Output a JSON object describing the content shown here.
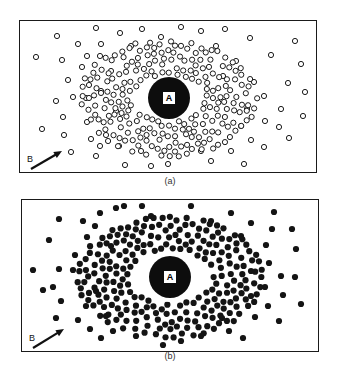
{
  "figure": {
    "panels": [
      {
        "id": "a",
        "caption": "(a)",
        "style": "hollow",
        "box": {
          "x": 19,
          "y": 20,
          "w": 298,
          "h": 153
        },
        "center": {
          "x": 168,
          "y": 97,
          "r": 21,
          "label": "A"
        },
        "gap_ring": 0,
        "dot_radius": 2.6,
        "arrow": {
          "label": "B",
          "x1": 30,
          "y1": 168,
          "x2": 61,
          "y2": 150,
          "label_x": 26,
          "label_y": 153
        },
        "caption_pos": {
          "x": 150,
          "y": 176
        },
        "outer_dots": [
          [
            56,
            35
          ],
          [
            95,
            27
          ],
          [
            119,
            32
          ],
          [
            77,
            43
          ],
          [
            100,
            43
          ],
          [
            35,
            56
          ],
          [
            61,
            59
          ],
          [
            86,
            55
          ],
          [
            99,
            55
          ],
          [
            81,
            66
          ],
          [
            67,
            79
          ],
          [
            88,
            84
          ],
          [
            100,
            90
          ],
          [
            55,
            100
          ],
          [
            72,
            96
          ],
          [
            85,
            97
          ],
          [
            62,
            116
          ],
          [
            41,
            128
          ],
          [
            63,
            134
          ],
          [
            86,
            121
          ],
          [
            90,
            138
          ],
          [
            99,
            145
          ],
          [
            70,
            151
          ],
          [
            95,
            155
          ],
          [
            124,
            164
          ],
          [
            105,
            134
          ],
          [
            141,
            28
          ],
          [
            180,
            26
          ],
          [
            167,
            163
          ],
          [
            249,
            37
          ],
          [
            294,
            40
          ],
          [
            224,
            28
          ],
          [
            270,
            54
          ],
          [
            300,
            63
          ],
          [
            287,
            82
          ],
          [
            304,
            91
          ],
          [
            263,
            95
          ],
          [
            280,
            108
          ],
          [
            302,
            115
          ],
          [
            278,
            126
          ],
          [
            288,
            137
          ],
          [
            263,
            146
          ],
          [
            243,
            163
          ],
          [
            264,
            120
          ],
          [
            250,
            139
          ],
          [
            246,
            108
          ],
          [
            253,
            81
          ],
          [
            200,
            30
          ],
          [
            160,
            36
          ],
          [
            130,
            45
          ],
          [
            215,
            45
          ],
          [
            235,
            60
          ],
          [
            110,
            70
          ],
          [
            230,
            150
          ],
          [
            200,
            150
          ],
          [
            140,
            150
          ],
          [
            115,
            110
          ],
          [
            222,
            75
          ],
          [
            240,
            125
          ],
          [
            118,
            145
          ],
          [
            210,
            160
          ],
          [
            150,
            165
          ]
        ],
        "inner": {
          "count": 230,
          "r_min": 25,
          "r_max": 62,
          "seed": 7,
          "aspect": 1.45
        }
      },
      {
        "id": "b",
        "caption": "(b)",
        "style": "filled",
        "box": {
          "x": 21,
          "y": 199,
          "w": 298,
          "h": 153
        },
        "center": {
          "x": 169,
          "y": 276,
          "r": 21,
          "label": "A"
        },
        "gap_ring": 4,
        "dot_radius": 3.1,
        "arrow": {
          "label": "B",
          "x1": 32,
          "y1": 347,
          "x2": 63,
          "y2": 328,
          "label_x": 28,
          "label_y": 332
        },
        "caption_pos": {
          "x": 150,
          "y": 351
        },
        "outer_dots": [
          [
            58,
            218
          ],
          [
            82,
            220
          ],
          [
            99,
            212
          ],
          [
            48,
            239
          ],
          [
            94,
            225
          ],
          [
            115,
            207
          ],
          [
            32,
            269
          ],
          [
            58,
            268
          ],
          [
            72,
            269
          ],
          [
            52,
            286
          ],
          [
            60,
            300
          ],
          [
            55,
            317
          ],
          [
            77,
            319
          ],
          [
            89,
            328
          ],
          [
            100,
            337
          ],
          [
            42,
            289
          ],
          [
            86,
            236
          ],
          [
            74,
            254
          ],
          [
            123,
            205
          ],
          [
            141,
            205
          ],
          [
            190,
            205
          ],
          [
            230,
            212
          ],
          [
            273,
            211
          ],
          [
            271,
            228
          ],
          [
            291,
            228
          ],
          [
            265,
            244
          ],
          [
            295,
            248
          ],
          [
            268,
            262
          ],
          [
            280,
            275
          ],
          [
            294,
            276
          ],
          [
            264,
            286
          ],
          [
            282,
            294
          ],
          [
            300,
            303
          ],
          [
            267,
            305
          ],
          [
            254,
            316
          ],
          [
            278,
            320
          ],
          [
            242,
            337
          ],
          [
            221,
            317
          ],
          [
            250,
            295
          ],
          [
            250,
            222
          ],
          [
            240,
            235
          ],
          [
            112,
            330
          ],
          [
            135,
            335
          ],
          [
            162,
            344
          ],
          [
            200,
            335
          ],
          [
            180,
            340
          ],
          [
            105,
            315
          ],
          [
            110,
            245
          ],
          [
            228,
            330
          ],
          [
            150,
            215
          ],
          [
            210,
            220
          ],
          [
            250,
            270
          ],
          [
            95,
            290
          ],
          [
            85,
            305
          ]
        ],
        "inner": {
          "count": 250,
          "r_min": 29,
          "r_max": 64,
          "seed": 11,
          "aspect": 1.45
        }
      }
    ]
  }
}
